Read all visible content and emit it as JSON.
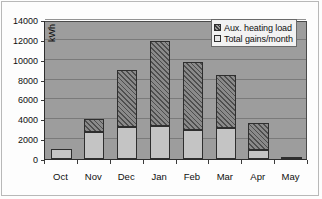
{
  "chart_data": {
    "type": "bar",
    "title": "",
    "xlabel": "",
    "ylabel": "kWh",
    "ylim": [
      0,
      14000
    ],
    "ytick_step": 2000,
    "yticks": [
      0,
      2000,
      4000,
      6000,
      8000,
      10000,
      12000,
      14000
    ],
    "grid": true,
    "stacked": true,
    "legend_position": "top-right",
    "categories": [
      "Oct",
      "Nov",
      "Dec",
      "Jan",
      "Feb",
      "Mar",
      "Apr",
      "May"
    ],
    "series": [
      {
        "name": "Total gains/month",
        "values": [
          1000,
          2700,
          3200,
          3300,
          2900,
          3100,
          900,
          200
        ]
      },
      {
        "name": "Aux. heating load",
        "values": [
          0,
          1300,
          5800,
          8600,
          6900,
          5400,
          2700,
          0
        ]
      }
    ],
    "totals": [
      1000,
      4000,
      9000,
      11900,
      9800,
      8500,
      3600,
      200
    ]
  },
  "legend": {
    "items": [
      {
        "label": "Aux. heating load",
        "swatch": "aux-hatched-swatch"
      },
      {
        "label": "Total gains/month",
        "swatch": "gains-light-swatch"
      }
    ]
  },
  "axis": {
    "y_unit_label": "kWh",
    "y_tick_labels": [
      "14000",
      "12000",
      "10000",
      "8000",
      "6000",
      "4000",
      "2000",
      "0"
    ],
    "x_tick_labels": [
      "Oct",
      "Nov",
      "Dec",
      "Jan",
      "Feb",
      "Mar",
      "Apr",
      "May"
    ]
  },
  "colors": {
    "plot_background": "#9d9d9d",
    "page_background": "#ffffff",
    "gridline": "#6f6f6f",
    "axis": "#2e2e2e",
    "series_gains": "#c4c4c4",
    "series_aux": "#6e6e6e",
    "legend_background": "#f2f2f2",
    "text": "#0f0f0f"
  }
}
